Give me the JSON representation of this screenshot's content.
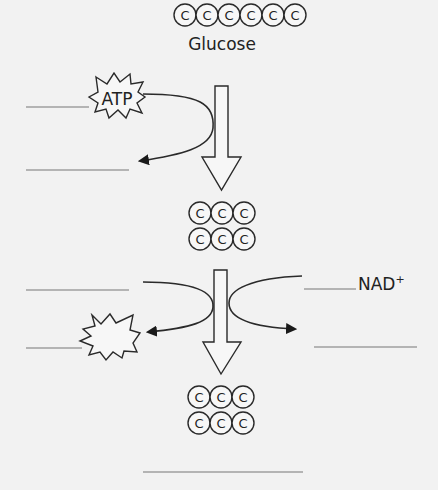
{
  "diagram": {
    "glucose": {
      "label": "Glucose",
      "carbon_count": 6,
      "carbon_symbol": "C"
    },
    "intermediate": {
      "rows": 2,
      "carbons_per_row": 3,
      "carbon_symbol": "C"
    },
    "product": {
      "rows": 2,
      "carbons_per_row": 3,
      "carbon_symbol": "C"
    },
    "energy_input": {
      "burst_label": "ATP"
    },
    "energy_output": {
      "burst_label": ""
    },
    "electron_carrier": {
      "label": "NAD",
      "superscript": "+"
    },
    "blanks": [
      {
        "id": "blank-atp-input",
        "value": ""
      },
      {
        "id": "blank-atp-product",
        "value": ""
      },
      {
        "id": "blank-step2-input",
        "value": ""
      },
      {
        "id": "blank-step2-burst",
        "value": ""
      },
      {
        "id": "blank-nad-input",
        "value": ""
      },
      {
        "id": "blank-nad-output",
        "value": ""
      },
      {
        "id": "blank-final-product",
        "value": ""
      }
    ],
    "colors": {
      "background": "#f2f2f2",
      "stroke": "#2a2a2a",
      "blank_line": "#777777"
    }
  }
}
